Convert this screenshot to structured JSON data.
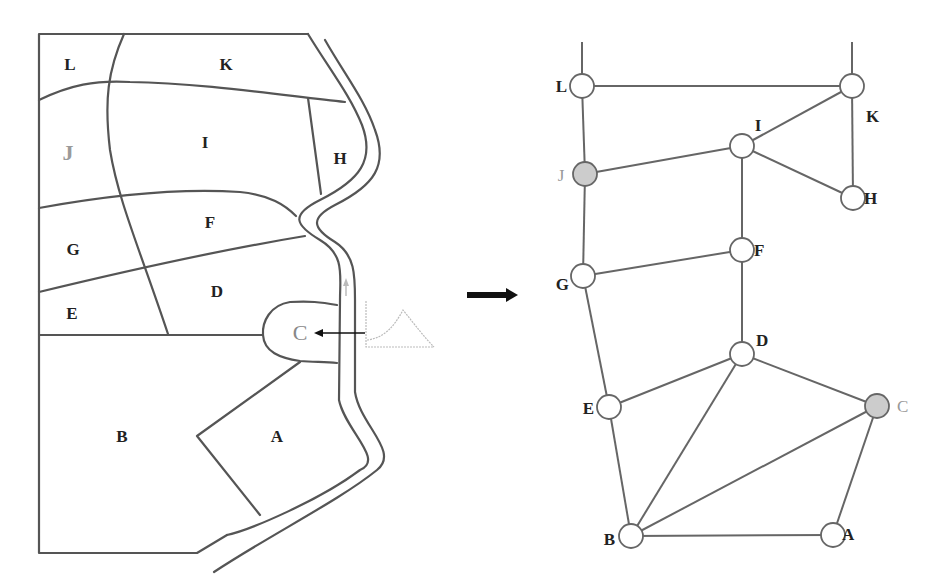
{
  "map": {
    "regions": [
      {
        "id": "L",
        "label": "L",
        "x": 70,
        "y": 70
      },
      {
        "id": "K",
        "label": "K",
        "x": 226,
        "y": 70
      },
      {
        "id": "J",
        "label": "J",
        "x": 68,
        "y": 160,
        "highlighted": true
      },
      {
        "id": "I",
        "label": "I",
        "x": 205,
        "y": 148
      },
      {
        "id": "H",
        "label": "H",
        "x": 340,
        "y": 164
      },
      {
        "id": "G",
        "label": "G",
        "x": 73,
        "y": 255
      },
      {
        "id": "F",
        "label": "F",
        "x": 210,
        "y": 228
      },
      {
        "id": "D",
        "label": "D",
        "x": 217,
        "y": 297
      },
      {
        "id": "E",
        "label": "E",
        "x": 72,
        "y": 319
      },
      {
        "id": "C",
        "label": "C",
        "x": 300,
        "y": 339,
        "highlighted": true
      },
      {
        "id": "B",
        "label": "B",
        "x": 122,
        "y": 442
      },
      {
        "id": "A",
        "label": "A",
        "x": 277,
        "y": 442
      }
    ]
  },
  "transform_arrow": {
    "direction": "right"
  },
  "graph": {
    "nodes": [
      {
        "id": "L",
        "label": "L",
        "x": 582,
        "y": 86,
        "lx": 567,
        "ly": 92,
        "anchor": "end"
      },
      {
        "id": "K",
        "label": "K",
        "x": 852,
        "y": 86,
        "lx": 866,
        "ly": 122,
        "anchor": "start"
      },
      {
        "id": "I",
        "label": "I",
        "x": 742,
        "y": 146,
        "lx": 758,
        "ly": 131,
        "anchor": "middle"
      },
      {
        "id": "J",
        "label": "J",
        "x": 585,
        "y": 174,
        "lx": 563,
        "ly": 180,
        "anchor": "middle",
        "highlighted": true
      },
      {
        "id": "H",
        "label": "H",
        "x": 853,
        "y": 198,
        "lx": 865,
        "ly": 204,
        "anchor": "start"
      },
      {
        "id": "F",
        "label": "F",
        "x": 742,
        "y": 250,
        "lx": 755,
        "ly": 256,
        "anchor": "start"
      },
      {
        "id": "G",
        "label": "G",
        "x": 583,
        "y": 276,
        "lx": 569,
        "ly": 290,
        "anchor": "end"
      },
      {
        "id": "D",
        "label": "D",
        "x": 742,
        "y": 354,
        "lx": 756,
        "ly": 346,
        "anchor": "start"
      },
      {
        "id": "E",
        "label": "E",
        "x": 609,
        "y": 407,
        "lx": 594,
        "ly": 414,
        "anchor": "end"
      },
      {
        "id": "C",
        "label": "C",
        "x": 877,
        "y": 406,
        "lx": 897,
        "ly": 412,
        "anchor": "start",
        "highlighted": true
      },
      {
        "id": "B",
        "label": "B",
        "x": 631,
        "y": 536,
        "lx": 615,
        "ly": 545,
        "anchor": "end"
      },
      {
        "id": "A",
        "label": "A",
        "x": 833,
        "y": 535,
        "lx": 843,
        "ly": 540,
        "anchor": "start"
      }
    ],
    "edges": [
      [
        "L",
        "K"
      ],
      [
        "L",
        "J"
      ],
      [
        "K",
        "I"
      ],
      [
        "K",
        "H"
      ],
      [
        "I",
        "H"
      ],
      [
        "I",
        "J"
      ],
      [
        "I",
        "F"
      ],
      [
        "J",
        "G"
      ],
      [
        "G",
        "F"
      ],
      [
        "G",
        "E"
      ],
      [
        "F",
        "D"
      ],
      [
        "D",
        "E"
      ],
      [
        "D",
        "C"
      ],
      [
        "D",
        "B"
      ],
      [
        "E",
        "B"
      ],
      [
        "C",
        "B"
      ],
      [
        "C",
        "A"
      ],
      [
        "B",
        "A"
      ]
    ],
    "open_edges": [
      {
        "from": "L",
        "to_x": 582,
        "to_y": 42
      },
      {
        "from": "K",
        "to_x": 852,
        "to_y": 42
      }
    ]
  }
}
